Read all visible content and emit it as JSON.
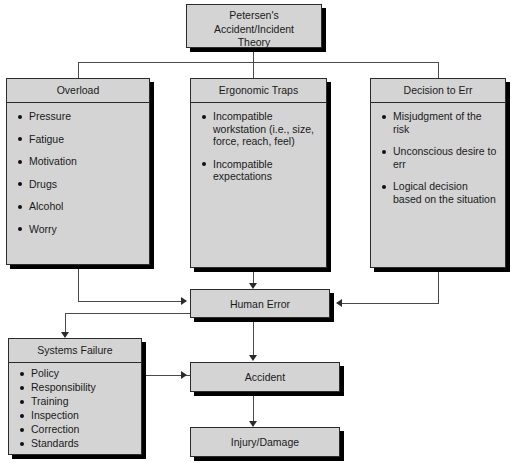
{
  "diagram": {
    "title_box": {
      "lines": [
        "Petersen's",
        "Accident/Incident",
        "Theory"
      ],
      "text": "Petersen's Accident/Incident Theory"
    },
    "columns": [
      {
        "id": "overload",
        "header": "Overload",
        "items": [
          "Pressure",
          "Fatigue",
          "Motivation",
          "Drugs",
          "Alcohol",
          "Worry"
        ]
      },
      {
        "id": "ergonomic-traps",
        "header": "Ergonomic Traps",
        "items": [
          "Incompatible workstation (i.e., size, force, reach, feel)",
          "Incompatible expectations"
        ]
      },
      {
        "id": "decision-to-err",
        "header": "Decision to Err",
        "items": [
          "Misjudgment of the risk",
          "Unconscious desire to err",
          "Logical decision based on the situation"
        ]
      }
    ],
    "systems_failure": {
      "header": "Systems Failure",
      "items": [
        "Policy",
        "Responsibility",
        "Training",
        "Inspection",
        "Correction",
        "Standards"
      ]
    },
    "outcomes": {
      "human_error": "Human Error",
      "accident": "Accident",
      "injury_damage": "Injury/Damage"
    },
    "colors": {
      "box_fill": "#d4d4d4",
      "box_border": "#2b2b2b",
      "shadow": "#000000",
      "connector": "#4a4a4a",
      "text": "#1a1a1a",
      "background": "#ffffff"
    }
  }
}
